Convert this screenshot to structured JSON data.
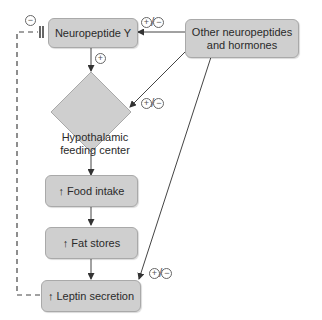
{
  "nodes": {
    "npy": "Neuropeptide Y",
    "other": "Other neuropeptides and hormones",
    "other_line1": "Other neuropeptides",
    "other_line2": "and hormones",
    "hypo_line1": "Hypothalamic",
    "hypo_line2": "feeding center",
    "food": "Food intake",
    "fat": "Fat stores",
    "leptin": "Leptin secretion"
  },
  "symbols": {
    "increase": "↑",
    "plus": "+",
    "minus": "−",
    "slash": "/"
  },
  "colors": {
    "node_fill": "#cfcfcf",
    "node_border": "#a9a9a9",
    "line": "#444444"
  }
}
